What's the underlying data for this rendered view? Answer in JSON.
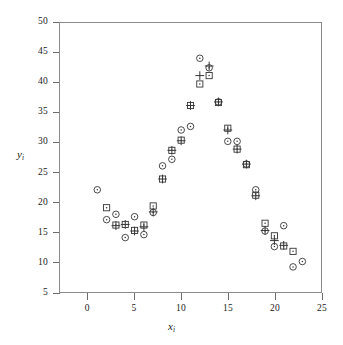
{
  "figure": {
    "title": "",
    "xlabel_base": "x",
    "xlabel_sub": "i",
    "ylabel_base": "y",
    "ylabel_sub": "i"
  },
  "axes": {
    "x_ticks": [
      0,
      5,
      10,
      15,
      20,
      25
    ],
    "y_ticks": [
      5,
      10,
      15,
      20,
      25,
      30,
      35,
      40,
      45,
      50
    ],
    "xlim": [
      -3,
      25
    ],
    "ylim": [
      5,
      50
    ],
    "grid": false,
    "frame_color": "#8a8a8a",
    "tick_color": "#6d6d6d"
  },
  "chart_data": {
    "type": "scatter",
    "title": "",
    "xlabel": "x_i",
    "ylabel": "y_i",
    "xlim": [
      -3,
      25
    ],
    "ylim": [
      5,
      50
    ],
    "grid": false,
    "legend": "none",
    "marker_color": "#333333",
    "series": [
      {
        "name": "circle",
        "marker": "circle-dot",
        "points": [
          [
            1,
            22.1
          ],
          [
            2,
            17.1
          ],
          [
            3,
            18.0
          ],
          [
            4,
            14.1
          ],
          [
            5,
            17.6
          ],
          [
            6,
            14.6
          ],
          [
            7,
            18.3
          ],
          [
            8,
            26.1
          ],
          [
            9,
            27.2
          ],
          [
            10,
            32.1
          ],
          [
            11,
            32.7
          ],
          [
            12,
            44.1
          ],
          [
            13,
            42.5
          ],
          [
            14,
            36.8
          ],
          [
            15,
            30.2
          ],
          [
            16,
            30.2
          ],
          [
            17,
            26.4
          ],
          [
            18,
            22.1
          ],
          [
            19,
            15.2
          ],
          [
            20,
            12.6
          ],
          [
            21,
            16.1
          ],
          [
            22,
            9.2
          ],
          [
            23,
            10.1
          ]
        ]
      },
      {
        "name": "square",
        "marker": "square-dot",
        "points": [
          [
            2,
            19.1
          ],
          [
            3,
            16.2
          ],
          [
            4,
            16.3
          ],
          [
            5,
            15.3
          ],
          [
            6,
            16.2
          ],
          [
            7,
            19.4
          ],
          [
            8,
            23.9
          ],
          [
            9,
            28.7
          ],
          [
            10,
            30.4
          ],
          [
            11,
            36.2
          ],
          [
            12,
            39.8
          ],
          [
            13,
            41.2
          ],
          [
            14,
            36.7
          ],
          [
            15,
            32.4
          ],
          [
            16,
            28.9
          ],
          [
            17,
            26.3
          ],
          [
            18,
            21.2
          ],
          [
            19,
            16.5
          ],
          [
            20,
            14.4
          ],
          [
            21,
            12.7
          ],
          [
            22,
            11.8
          ]
        ]
      },
      {
        "name": "plus",
        "marker": "plus",
        "points": [
          [
            3,
            16.1
          ],
          [
            4,
            16.3
          ],
          [
            5,
            15.2
          ],
          [
            6,
            15.9
          ],
          [
            7,
            18.4
          ],
          [
            8,
            23.9
          ],
          [
            9,
            28.7
          ],
          [
            10,
            30.3
          ],
          [
            11,
            36.2
          ],
          [
            12,
            41.2
          ],
          [
            13,
            42.8
          ],
          [
            14,
            36.8
          ],
          [
            15,
            32.1
          ],
          [
            16,
            28.9
          ],
          [
            17,
            26.4
          ],
          [
            18,
            21.1
          ],
          [
            19,
            15.3
          ],
          [
            20,
            13.6
          ],
          [
            21,
            12.8
          ]
        ]
      }
    ]
  }
}
